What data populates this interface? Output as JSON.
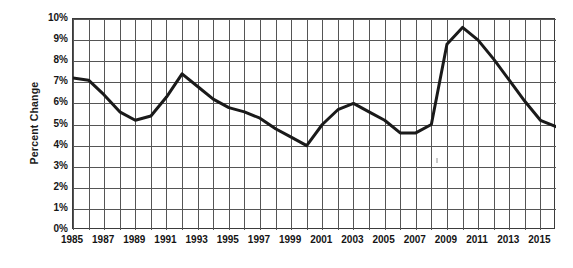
{
  "chart_data": {
    "type": "line",
    "title": "",
    "xlabel": "",
    "ylabel": "Percent Change",
    "xlim": [
      1985,
      2016
    ],
    "ylim": [
      0,
      10
    ],
    "grid": true,
    "legend": "none",
    "y_tick_labels": [
      "10%",
      "9%",
      "8%",
      "7%",
      "6%",
      "5%",
      "4%",
      "3%",
      "2%",
      "1%",
      "0%"
    ],
    "y_tick_values": [
      10,
      9,
      8,
      7,
      6,
      5,
      4,
      3,
      2,
      1,
      0
    ],
    "x_tick_labels": [
      "1985",
      "1987",
      "1989",
      "1991",
      "1993",
      "1995",
      "1997",
      "1999",
      "2001",
      "2003",
      "2005",
      "2007",
      "2009",
      "2011",
      "2013",
      "2015"
    ],
    "x_tick_values": [
      1985,
      1987,
      1989,
      1991,
      1993,
      1995,
      1997,
      1999,
      2001,
      2003,
      2005,
      2007,
      2009,
      2011,
      2013,
      2015
    ],
    "x": [
      1985,
      1986,
      1987,
      1988,
      1989,
      1990,
      1991,
      1992,
      1993,
      1994,
      1995,
      1996,
      1997,
      1998,
      1999,
      2000,
      2001,
      2002,
      2003,
      2004,
      2005,
      2006,
      2007,
      2008,
      2009,
      2010,
      2011,
      2012,
      2013,
      2014,
      2015,
      2016
    ],
    "values": [
      7.2,
      7.1,
      6.4,
      5.6,
      5.2,
      5.4,
      6.3,
      7.4,
      6.8,
      6.2,
      5.8,
      5.6,
      5.3,
      4.8,
      4.4,
      4.0,
      5.0,
      5.7,
      6.0,
      5.6,
      5.2,
      4.6,
      4.6,
      5.0,
      8.8,
      9.6,
      9.0,
      8.1,
      7.1,
      6.1,
      5.2,
      4.9
    ],
    "series_name": "Percent Change",
    "line_color": "#1a1a1a",
    "line_width": 3,
    "grid_color": "#555555",
    "frame_color": "#3b3b3b",
    "background": "#ffffff"
  }
}
